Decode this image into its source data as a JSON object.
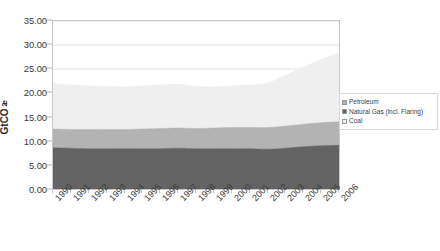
{
  "chart_data": {
    "type": "area",
    "stacked": true,
    "title": "",
    "xlabel": "",
    "ylabel": "GtCO2e",
    "ylabel_parts": {
      "pre": "GtCO",
      "sub": "2",
      "post": "e"
    },
    "categories": [
      "1990",
      "1991",
      "1992",
      "1993",
      "1994",
      "1995",
      "1996",
      "1997",
      "1998",
      "1999",
      "2000",
      "2001",
      "2002",
      "2003",
      "2004",
      "2005",
      "2006"
    ],
    "ylim": [
      0,
      35
    ],
    "yticks": [
      0,
      5,
      10,
      15,
      20,
      25,
      30,
      35
    ],
    "ytick_labels": [
      "0.00",
      "5.00",
      "10.00",
      "15.00",
      "20.00",
      "25.00",
      "30.00",
      "35.00"
    ],
    "grid": true,
    "legend_position": "right",
    "series": [
      {
        "name": "Petroleum",
        "color": "#636363",
        "values": [
          8.6,
          8.5,
          8.4,
          8.4,
          8.4,
          8.4,
          8.4,
          8.5,
          8.4,
          8.4,
          8.4,
          8.4,
          8.3,
          8.5,
          8.8,
          9.0,
          9.1
        ]
      },
      {
        "name": "Natural Gas (incl. Flaring)",
        "color": "#b3b3b3",
        "values": [
          3.9,
          3.9,
          4.0,
          4.0,
          4.0,
          4.1,
          4.2,
          4.2,
          4.2,
          4.3,
          4.4,
          4.4,
          4.5,
          4.6,
          4.7,
          4.8,
          4.9
        ]
      },
      {
        "name": "Coal",
        "color": "#efefef",
        "values": [
          9.5,
          9.3,
          9.1,
          9.0,
          8.9,
          9.0,
          9.1,
          9.1,
          8.8,
          8.6,
          8.7,
          8.9,
          9.3,
          10.6,
          11.9,
          13.2,
          14.3
        ]
      }
    ],
    "totals": [
      22.0,
      21.7,
      21.5,
      21.4,
      21.3,
      21.5,
      21.7,
      21.8,
      21.4,
      21.3,
      21.5,
      21.7,
      22.1,
      23.7,
      25.4,
      27.0,
      28.3
    ]
  },
  "legend": {
    "items": [
      {
        "label": "Petroleum",
        "color": "#b3b3b3"
      },
      {
        "label": "Natural Gas (incl. Flaring)",
        "color": "#636363"
      },
      {
        "label": "Coal",
        "color": "#efefef"
      }
    ]
  }
}
